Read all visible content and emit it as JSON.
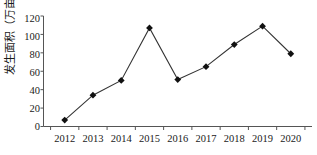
{
  "chart_data": {
    "type": "line",
    "title": "",
    "xlabel": "",
    "ylabel": "发生面积（万亩）",
    "categories": [
      "2012",
      "2013",
      "2014",
      "2015",
      "2016",
      "2017",
      "2018",
      "2019",
      "2020"
    ],
    "values": [
      7,
      34,
      50,
      107,
      51,
      65,
      89,
      109,
      79
    ],
    "ylim": [
      0,
      120
    ],
    "yticks": [
      0,
      20,
      40,
      60,
      80,
      100,
      120
    ],
    "ytick_labels": [
      "0",
      "20",
      "40",
      "60",
      "80",
      "100",
      "120"
    ],
    "grid": false,
    "legend": null,
    "series": [
      {
        "name": "发生面积（万亩）",
        "values": [
          7,
          34,
          50,
          107,
          51,
          65,
          89,
          109,
          79
        ],
        "marker": "diamond",
        "marker_color": "#111111",
        "line_color": "#333333"
      }
    ],
    "annotations": []
  },
  "style": {
    "axis_color": "#555555",
    "line_color": "#333333",
    "marker_color": "#111111",
    "background": "#ffffff",
    "text_color": "#1a1a1a"
  }
}
